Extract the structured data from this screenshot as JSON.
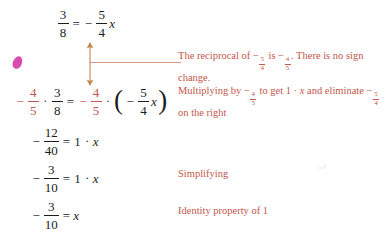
{
  "document": {
    "type": "algebra-worked-example",
    "background_color": "#ffffff",
    "text_color": "#1c1c1c",
    "accent_color": "#c2564a",
    "mark_color": "#d63ca8"
  },
  "equations": [
    {
      "id": "line-1",
      "plain": "3/8 = -5/4 x",
      "left": {
        "frac_num": "3",
        "frac_den": "8"
      },
      "relation": "=",
      "right": {
        "sign": "−",
        "frac_num": "5",
        "frac_den": "4",
        "variable": "x"
      }
    },
    {
      "id": "line-2",
      "plain": "-4/5 · 3/8 = -4/5 · (-5/4 x)",
      "lhs_sign": "−",
      "lhs_mult_num": "4",
      "lhs_mult_den": "5",
      "lhs_dot": "·",
      "lhs_frac_num": "3",
      "lhs_frac_den": "8",
      "relation": "=",
      "rhs_sign": "−",
      "rhs_mult_num": "4",
      "rhs_mult_den": "5",
      "rhs_dot": "·",
      "paren_open": "(",
      "paren_sign": "−",
      "paren_num": "5",
      "paren_den": "4",
      "paren_var": "x",
      "paren_close": ")"
    },
    {
      "id": "line-3",
      "plain": "-12/40 = 1 · x",
      "sign": "−",
      "frac_num": "12",
      "frac_den": "40",
      "relation": "=",
      "one": "1",
      "dot": "·",
      "variable": "x"
    },
    {
      "id": "line-4",
      "plain": "-3/10 = 1 · x",
      "sign": "−",
      "frac_num": "3",
      "frac_den": "10",
      "relation": "=",
      "one": "1",
      "dot": "·",
      "variable": "x"
    },
    {
      "id": "line-5",
      "plain": "-3/10 = x",
      "sign": "−",
      "frac_num": "3",
      "frac_den": "10",
      "relation": "=",
      "variable": "x"
    }
  ],
  "notes": {
    "reciprocal": {
      "part1": "The reciprocal of ",
      "f1_sign": "−",
      "f1_num": "5",
      "f1_den": "4",
      "part2": " is ",
      "f2_sign": "−",
      "f2_num": "4",
      "f2_den": "5",
      "part3": ". There is no sign change.",
      "plain": "The reciprocal of −5/4 is −4/5. There is no sign change."
    },
    "multiplying": {
      "part1": "Multiplying by ",
      "f1_sign": "−",
      "f1_num": "4",
      "f1_den": "5",
      "part2": " to get 1 · ",
      "var": "x",
      "part3": " and eliminate ",
      "f2_sign": "−",
      "f2_num": "5",
      "f2_den": "4",
      "part4": " on the right",
      "plain": "Multiplying by −4/5 to get 1 · x and eliminate −5/4 on the right"
    },
    "simplifying": {
      "text": "Simplifying"
    },
    "identity": {
      "text": "Identity property of 1"
    }
  },
  "annotation_arrow": {
    "name": "double-headed-vertical-arrow-with-leader",
    "color": "#c2864a",
    "description": "Double-headed vertical arrow linking the -5/4 in line 1 to the -5/4 in line 2, with a horizontal leader line to the reciprocal note"
  }
}
